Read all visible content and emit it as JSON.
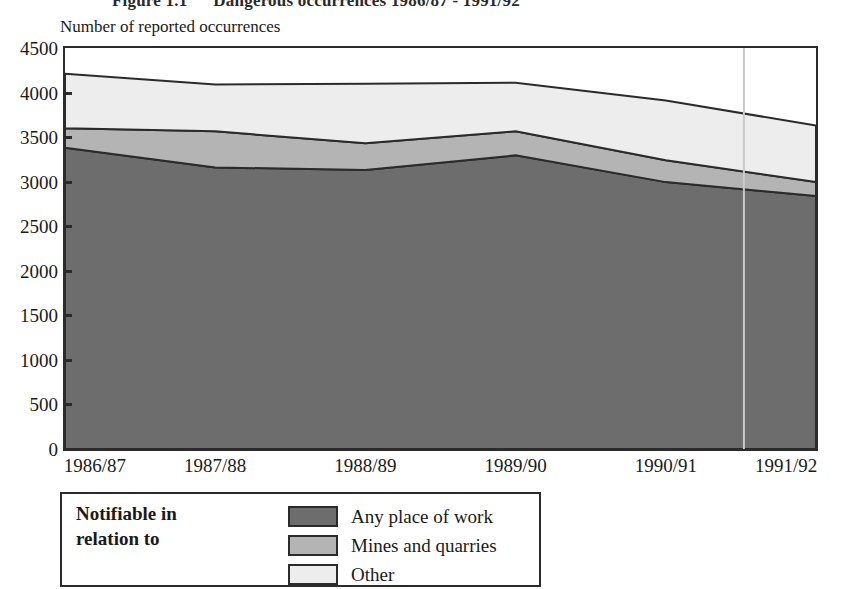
{
  "figure": {
    "number": "Figure 1.1",
    "caption": "Dangerous occurrences 1986/87 - 1991/92",
    "y_axis_caption": "Number of reported occurrences"
  },
  "legend": {
    "title_line_1": "Notifiable in",
    "title_line_2": "relation to",
    "entries": [
      {
        "label": "Any place of work",
        "color": "#6d6d6d"
      },
      {
        "label": "Mines and quarries",
        "color": "#b4b4b4"
      },
      {
        "label": "Other",
        "color": "#ededed"
      }
    ]
  },
  "chart_data": {
    "type": "area",
    "stacked": true,
    "xlabel": "",
    "ylabel": "Number of reported occurrences",
    "categories": [
      "1986/87",
      "1987/88",
      "1988/89",
      "1989/90",
      "1990/91",
      "1991/92"
    ],
    "ylim": [
      0,
      4500
    ],
    "yticks": [
      0,
      500,
      1000,
      1500,
      2000,
      2500,
      3000,
      3500,
      4000,
      4500
    ],
    "grid": false,
    "legend_position": "below-plot",
    "series": [
      {
        "name": "Any place of work",
        "color": "#6d6d6d",
        "values": [
          3380,
          3160,
          3130,
          3295,
          2995,
          2840
        ]
      },
      {
        "name": "Mines and quarries",
        "color": "#b4b4b4",
        "values": [
          220,
          405,
          300,
          270,
          245,
          155
        ]
      },
      {
        "name": "Other",
        "color": "#ededed",
        "values": [
          610,
          525,
          670,
          545,
          670,
          635
        ]
      }
    ],
    "totals": [
      4210,
      4090,
      4100,
      4110,
      3910,
      3630
    ]
  }
}
